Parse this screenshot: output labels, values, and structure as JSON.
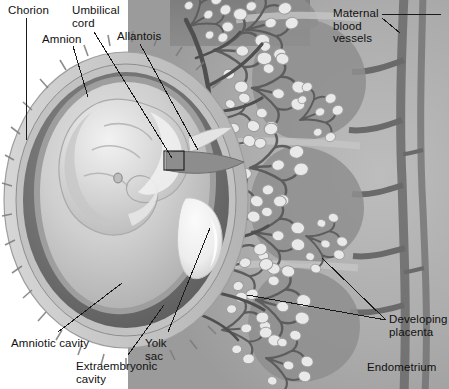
{
  "figure": {
    "type": "anatomical-illustration",
    "style": "grayscale halftone textbook figure",
    "width": 449,
    "height": 389,
    "background_color": "#ffffff"
  },
  "colors": {
    "page_background": "#ffffff",
    "uterine_tissue": "#b9b9b9",
    "dark_band": "#7d7d7d",
    "endometrium_field": "#a9a9a9",
    "chorion_rim": "#c9c9c9",
    "chorionic_cavity_dark": "#6e6e6e",
    "amniotic_cavity": "#cfcfcf",
    "embryo_body": "#dcdcdc",
    "embryo_highlight": "#f0f0f0",
    "yolk_sac": "#f6f6f6",
    "vessel_dark": "#5a5a5a",
    "villi_light": "#e6e6e6",
    "leader_line": "#1a1a1a",
    "label_text": "#111111"
  },
  "labels": [
    {
      "id": "chorion",
      "text": "Chorion",
      "x": 8,
      "y": 4,
      "align": "left"
    },
    {
      "id": "umbilical-cord",
      "text": "Umbilical\ncord",
      "x": 72,
      "y": 4,
      "align": "left"
    },
    {
      "id": "amnion",
      "text": "Amnion",
      "x": 42,
      "y": 33,
      "align": "left"
    },
    {
      "id": "allantois",
      "text": "Allantois",
      "x": 117,
      "y": 30,
      "align": "left"
    },
    {
      "id": "maternal-blood-vessels",
      "text": "Maternal\nblood\nvessels",
      "x": 333,
      "y": 7,
      "align": "left"
    },
    {
      "id": "amniotic-cavity",
      "text": "Amniotic cavity",
      "x": 11,
      "y": 337,
      "align": "left"
    },
    {
      "id": "extraembryonic-cavity",
      "text": "Extraembryonic\ncavity",
      "x": 76,
      "y": 360,
      "align": "left"
    },
    {
      "id": "yolk-sac",
      "text": "Yolk\nsac",
      "x": 145,
      "y": 337,
      "align": "left"
    },
    {
      "id": "developing-placenta",
      "text": "Developing\nplacenta",
      "x": 389,
      "y": 313,
      "align": "left"
    },
    {
      "id": "endometrium",
      "text": "Endometrium",
      "x": 367,
      "y": 361,
      "align": "left"
    }
  ],
  "leaders": [
    {
      "id": "leader-chorion",
      "from": [
        26,
        18
      ],
      "to": [
        26,
        140
      ]
    },
    {
      "id": "leader-amnion",
      "from": [
        73,
        46
      ],
      "to": [
        88,
        97
      ]
    },
    {
      "id": "leader-umbilical-cord",
      "from": [
        94,
        32
      ],
      "to": [
        172,
        158
      ]
    },
    {
      "id": "leader-allantois",
      "from": [
        140,
        44
      ],
      "to": [
        198,
        150
      ]
    },
    {
      "id": "leader-maternal-blood-vessels",
      "from": [
        382,
        14
      ],
      "to": [
        441,
        14
      ]
    },
    {
      "id": "leader-maternal-vessel-tick",
      "from": [
        382,
        18
      ],
      "to": [
        400,
        33
      ]
    },
    {
      "id": "leader-amniotic-cavity",
      "from": [
        58,
        332
      ],
      "to": [
        122,
        283
      ]
    },
    {
      "id": "leader-extraembryonic-cavity",
      "from": [
        128,
        355
      ],
      "to": [
        164,
        305
      ]
    },
    {
      "id": "leader-yolk-sac",
      "from": [
        168,
        332
      ],
      "to": [
        210,
        228
      ]
    },
    {
      "id": "leader-developing-placenta-a",
      "from": [
        386,
        320
      ],
      "to": [
        247,
        295
      ]
    },
    {
      "id": "leader-developing-placenta-b",
      "from": [
        386,
        320
      ],
      "to": [
        322,
        258
      ]
    }
  ],
  "structures": [
    {
      "id": "chorion",
      "name": "Chorion",
      "description": "Outer membrane forming a villous ring around the conceptus"
    },
    {
      "id": "amnion",
      "name": "Amnion",
      "description": "Inner membrane enclosing the amniotic cavity around the embryo"
    },
    {
      "id": "umbilical-cord",
      "name": "Umbilical cord",
      "description": "Connecting stalk between embryo and developing placenta"
    },
    {
      "id": "allantois",
      "name": "Allantois",
      "description": "Outgrowth extending into the connecting stalk"
    },
    {
      "id": "amniotic-cavity",
      "name": "Amniotic cavity",
      "description": "Fluid-filled space enclosed by the amnion"
    },
    {
      "id": "extraembryonic-cavity",
      "name": "Extraembryonic cavity",
      "description": "Chorionic cavity between amnion and chorion"
    },
    {
      "id": "yolk-sac",
      "name": "Yolk sac",
      "description": "Pale sac ventral to the embryo"
    },
    {
      "id": "developing-placenta",
      "name": "Developing placenta",
      "description": "Branched chorionic villi invading the uterine wall"
    },
    {
      "id": "maternal-blood-vessels",
      "name": "Maternal blood vessels",
      "description": "Uterine vessels supplying the placental bed"
    },
    {
      "id": "endometrium",
      "name": "Endometrium",
      "description": "Uterine lining surrounding the implantation site"
    }
  ]
}
